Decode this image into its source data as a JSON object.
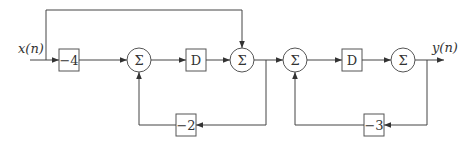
{
  "diagram": {
    "type": "block-diagram",
    "input_label": "x(n)",
    "output_label": "y(n)",
    "blocks": [
      {
        "id": "gain1",
        "kind": "gain",
        "label": "−4"
      },
      {
        "id": "sum1",
        "kind": "summer",
        "label": "Σ"
      },
      {
        "id": "delay1",
        "kind": "delay",
        "label": "D"
      },
      {
        "id": "sum2",
        "kind": "summer",
        "label": "Σ"
      },
      {
        "id": "gain2",
        "kind": "gain",
        "label": "−2"
      },
      {
        "id": "sum3",
        "kind": "summer",
        "label": "Σ"
      },
      {
        "id": "delay2",
        "kind": "delay",
        "label": "D"
      },
      {
        "id": "sum4",
        "kind": "summer",
        "label": "Σ"
      },
      {
        "id": "gain3",
        "kind": "gain",
        "label": "−3"
      }
    ],
    "connections": [
      {
        "from": "x(n)",
        "to": "gain1"
      },
      {
        "from": "x(n)",
        "to": "sum2",
        "path": "feedforward-top"
      },
      {
        "from": "gain1",
        "to": "sum1"
      },
      {
        "from": "sum1",
        "to": "delay1"
      },
      {
        "from": "delay1",
        "to": "sum2"
      },
      {
        "from": "sum2",
        "to": "sum3"
      },
      {
        "from": "sum2",
        "to": "gain2",
        "path": "feedback-bottom"
      },
      {
        "from": "gain2",
        "to": "sum1"
      },
      {
        "from": "sum3",
        "to": "delay2"
      },
      {
        "from": "delay2",
        "to": "sum4"
      },
      {
        "from": "sum4",
        "to": "y(n)"
      },
      {
        "from": "sum4",
        "to": "gain3",
        "path": "feedback-bottom"
      },
      {
        "from": "gain3",
        "to": "sum3"
      }
    ]
  }
}
